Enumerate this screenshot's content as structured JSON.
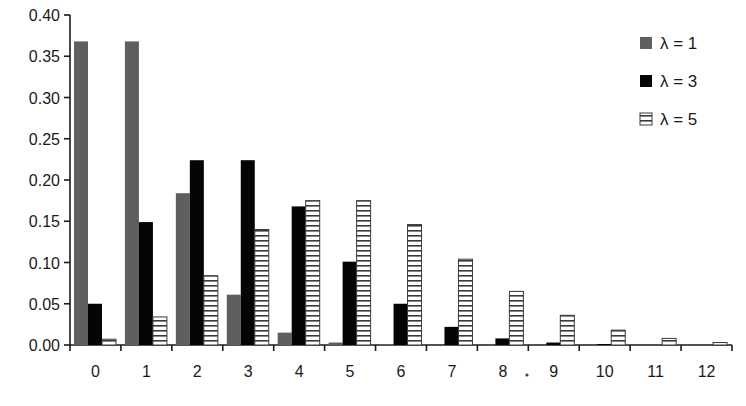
{
  "chart_data": {
    "type": "bar",
    "title": "",
    "xlabel": "",
    "ylabel": "",
    "ylim": [
      0,
      0.4
    ],
    "yticks": [
      "0.00",
      "0.05",
      "0.10",
      "0.15",
      "0.20",
      "0.25",
      "0.30",
      "0.35",
      "0.40"
    ],
    "grid": false,
    "legend_position": "top-right",
    "categories": [
      "0",
      "1",
      "2",
      "3",
      "4",
      "5",
      "6",
      "7",
      "8",
      "9",
      "10",
      "11",
      "12"
    ],
    "series": [
      {
        "name": "λ = 1",
        "color": "#5f5f5f",
        "pattern": "solid-gray",
        "values": [
          0.368,
          0.368,
          0.184,
          0.061,
          0.015,
          0.003,
          0.001,
          0.0,
          0.0,
          0.0,
          0.0,
          0.0,
          0.0
        ]
      },
      {
        "name": "λ = 3",
        "color": "#050505",
        "pattern": "solid-black",
        "values": [
          0.05,
          0.149,
          0.224,
          0.224,
          0.168,
          0.101,
          0.05,
          0.022,
          0.008,
          0.003,
          0.001,
          0.0,
          0.0
        ]
      },
      {
        "name": "λ = 5",
        "color": "#ffffff",
        "pattern": "horizontal-stripes",
        "values": [
          0.007,
          0.034,
          0.084,
          0.14,
          0.175,
          0.175,
          0.146,
          0.104,
          0.065,
          0.036,
          0.018,
          0.008,
          0.003
        ]
      }
    ]
  },
  "legend": {
    "items": [
      {
        "label": "λ = 1",
        "icon": "gray-square-swatch"
      },
      {
        "label": "λ = 3",
        "icon": "black-square-swatch"
      },
      {
        "label": "λ = 5",
        "icon": "striped-square-swatch"
      }
    ]
  }
}
